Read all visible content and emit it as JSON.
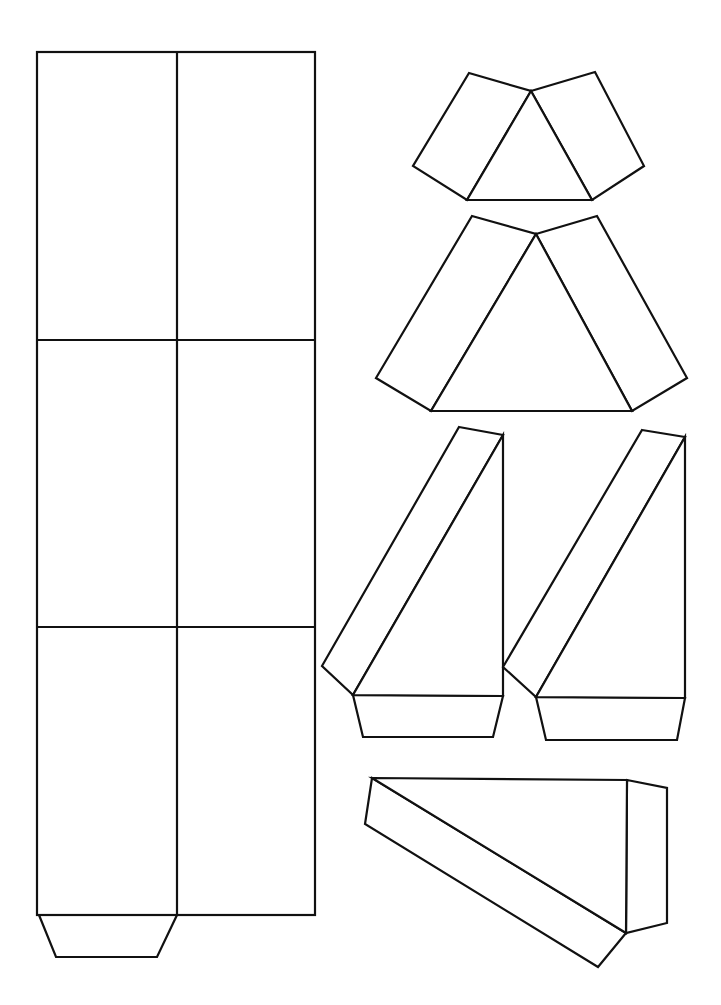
{
  "diagram": {
    "type": "paper-net-template",
    "stroke_color": "#111111",
    "background_color": "#ffffff",
    "pieces": [
      {
        "name": "rectangular-box-net",
        "description": "2 columns x 3 rows of rectangles with a trapezoid tab at the bottom-left"
      },
      {
        "name": "small-triangular-net",
        "description": "triangle with two rectangular side flaps"
      },
      {
        "name": "large-triangular-net",
        "description": "larger triangle with two rectangular side flaps"
      },
      {
        "name": "wedge-net-left",
        "description": "right-triangle face with slanted strip and bottom trapezoid tab"
      },
      {
        "name": "wedge-net-right",
        "description": "right-triangle face with slanted strip and bottom trapezoid tab"
      },
      {
        "name": "wedge-net-bottom",
        "description": "horizontal right-triangle face with slanted strip and side tab"
      }
    ]
  }
}
